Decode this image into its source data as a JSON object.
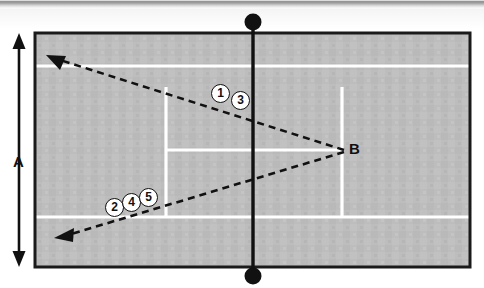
{
  "figure": {
    "surface_color": "#bdbdbd",
    "line_color": "#ffffff",
    "border_color": "#1a1a1a",
    "ink_color": "#111111"
  },
  "labels": {
    "dimension_a": "A",
    "target_b": "B"
  },
  "shot_markers": [
    {
      "id": "1",
      "text": "1"
    },
    {
      "id": "2",
      "text": "2"
    },
    {
      "id": "3",
      "text": "3"
    },
    {
      "id": "4",
      "text": "4"
    },
    {
      "id": "5",
      "text": "5"
    }
  ],
  "court": {
    "border": {
      "x": 35,
      "y": 33,
      "width": 435,
      "height": 234
    },
    "doubles_sideline_top_y": 66,
    "doubles_sideline_bottom_y": 217,
    "singles_sideline_left_x": 166,
    "singles_sideline_right_x": 342,
    "service_line_y": 150,
    "service_box_top_y": 88,
    "service_box_bottom_y": 218,
    "net_x": 253,
    "net_post_top": {
      "cx": 253,
      "cy": 22,
      "r": 8
    },
    "net_post_bottom": {
      "cx": 253,
      "cy": 276,
      "r": 8
    }
  },
  "arrows": {
    "dimension": {
      "x": 19,
      "y_top": 38,
      "y_bottom": 262,
      "head_size": 9
    },
    "shot_upper": {
      "from": {
        "x": 344,
        "y": 150
      },
      "to": {
        "x": 50,
        "y": 57
      },
      "dash": "7 5"
    },
    "shot_lower": {
      "from": {
        "x": 344,
        "y": 152
      },
      "to": {
        "x": 58,
        "y": 238
      },
      "dash": "7 5"
    }
  }
}
